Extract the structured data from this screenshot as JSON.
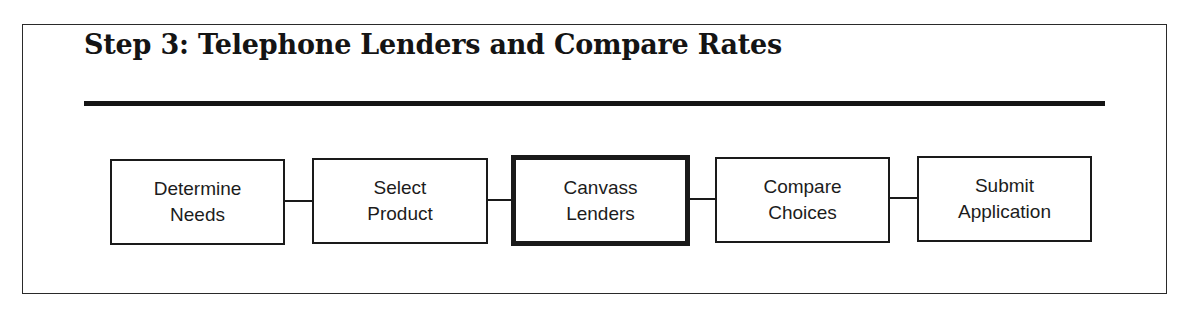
{
  "diagram": {
    "title": "Step 3: Telephone Lenders and Compare Rates",
    "active_step_index": 2,
    "steps": [
      {
        "line1": "Determine",
        "line2": "Needs",
        "active": false
      },
      {
        "line1": "Select",
        "line2": "Product",
        "active": false
      },
      {
        "line1": "Canvass",
        "line2": "Lenders",
        "active": true
      },
      {
        "line1": "Compare",
        "line2": "Choices",
        "active": false
      },
      {
        "line1": "Submit",
        "line2": "Application",
        "active": false
      }
    ]
  }
}
